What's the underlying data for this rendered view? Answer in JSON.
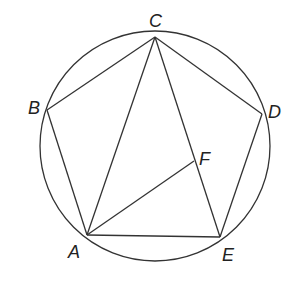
{
  "diagram": {
    "type": "circle-inscribed-pentagon",
    "circle": {
      "cx": 155,
      "cy": 146,
      "r": 115
    },
    "points": {
      "A": {
        "x": 87,
        "y": 235,
        "label": "A",
        "lx": 68,
        "ly": 243
      },
      "B": {
        "x": 47,
        "y": 110,
        "label": "B",
        "lx": 28,
        "ly": 99
      },
      "C": {
        "x": 155,
        "y": 37,
        "label": "C",
        "lx": 149,
        "ly": 12
      },
      "D": {
        "x": 262,
        "y": 114,
        "label": "D",
        "lx": 268,
        "ly": 103
      },
      "E": {
        "x": 220,
        "y": 237,
        "label": "E",
        "lx": 222,
        "ly": 246
      },
      "F": {
        "x": 194,
        "y": 161,
        "label": "F",
        "lx": 199,
        "ly": 150
      }
    },
    "segments": [
      [
        "A",
        "B"
      ],
      [
        "B",
        "C"
      ],
      [
        "C",
        "D"
      ],
      [
        "D",
        "E"
      ],
      [
        "E",
        "A"
      ],
      [
        "A",
        "C"
      ],
      [
        "C",
        "E"
      ],
      [
        "A",
        "F"
      ]
    ],
    "stroke_color": "#333333"
  }
}
